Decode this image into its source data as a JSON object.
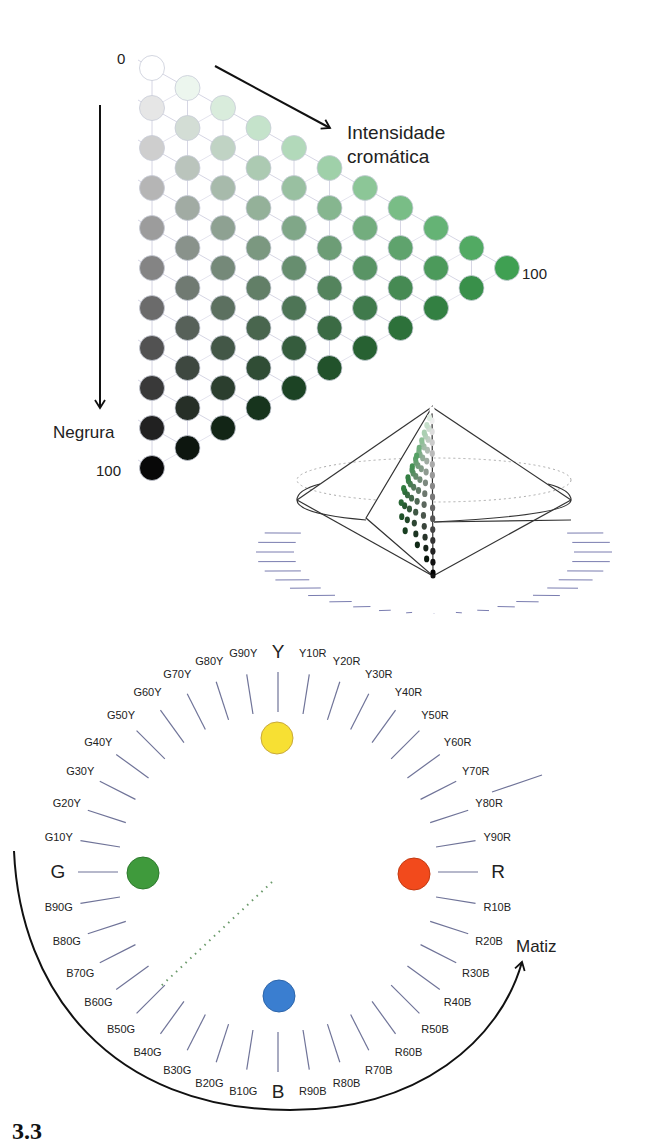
{
  "triangle": {
    "label_top": "0",
    "label_bottom": "100",
    "label_right": "100",
    "axis_chromatic": [
      "Intensidade",
      "cromática"
    ],
    "axis_blackness": "Negrura",
    "rows": 11,
    "hue_color": "#3fa052"
  },
  "hue_circle": {
    "primaries": [
      {
        "label": "Y",
        "color": "#f7e033"
      },
      {
        "label": "R",
        "color": "#f24a1c"
      },
      {
        "label": "B",
        "color": "#3a7ed0"
      },
      {
        "label": "G",
        "color": "#3f9a3c"
      }
    ],
    "hue_labels": [
      "Y",
      "Y10R",
      "Y20R",
      "Y30R",
      "Y40R",
      "Y50R",
      "Y60R",
      "Y70R",
      "Y80R",
      "Y90R",
      "R",
      "R10B",
      "R20B",
      "R30B",
      "R40B",
      "R50B",
      "R60B",
      "R70B",
      "R80B",
      "R90B",
      "B",
      "B10G",
      "B20G",
      "B30G",
      "B40G",
      "B50G",
      "B60G",
      "B70G",
      "B80G",
      "B90G",
      "G",
      "G10Y",
      "G20Y",
      "G30Y",
      "G40Y",
      "G50Y",
      "G60Y",
      "G70Y",
      "G80Y",
      "G90Y"
    ],
    "axis_hue": "Matiz"
  },
  "figure_number": "3.3"
}
